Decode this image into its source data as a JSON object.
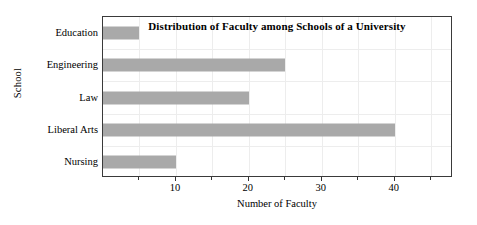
{
  "chart_data": {
    "type": "bar",
    "orientation": "horizontal",
    "title": "Distribution of Faculty among Schools of a University",
    "xlabel": "Number of Faculty",
    "ylabel": "School",
    "categories": [
      "Education",
      "Engineering",
      "Law",
      "Liberal Arts",
      "Nursing"
    ],
    "values": [
      5,
      25,
      20,
      40,
      10
    ],
    "xlim": [
      0,
      48
    ],
    "xticks": [
      10,
      20,
      30,
      40
    ],
    "xtick_labels": [
      "10",
      "20",
      "30",
      "40"
    ],
    "minor_xticks": [
      5,
      15,
      25,
      35,
      45
    ],
    "grid": true,
    "legend": false,
    "bar_color": "#a9a9a9",
    "grid_color": "#ededed",
    "frame_color": "#3a3a3a",
    "background": "#ffffff"
  }
}
